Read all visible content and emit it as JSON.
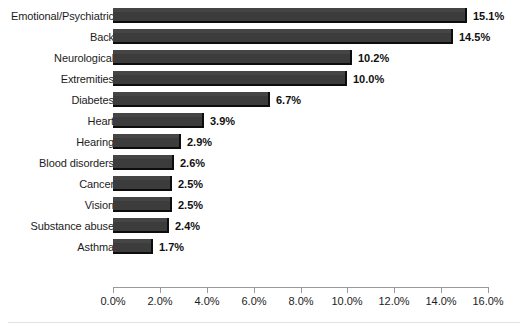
{
  "chart_data": {
    "type": "bar",
    "orientation": "horizontal",
    "title": "",
    "subtitle": "",
    "xlabel": "",
    "ylabel": "",
    "xlim": [
      0,
      16
    ],
    "grid": false,
    "legend": null,
    "bar_color": "#3c3c3c",
    "shadow_color": "#0d0d0d",
    "background": "#ffffff",
    "axis_color": "#9a9a9a",
    "text_color": "#1c1c1c",
    "value_suffix": "%",
    "categories": [
      "Emotional/Psychiatric",
      "Back",
      "Neurological",
      "Extremities",
      "Diabetes",
      "Heart",
      "Hearing",
      "Blood disorders",
      "Cancer",
      "Vision",
      "Substance abuse",
      "Asthma"
    ],
    "values": [
      15.1,
      14.5,
      10.2,
      10.0,
      6.7,
      3.9,
      2.9,
      2.6,
      2.5,
      2.5,
      2.4,
      1.7
    ],
    "data_labels": [
      "15.1%",
      "14.5%",
      "10.2%",
      "10.0%",
      "6.7%",
      "3.9%",
      "2.9%",
      "2.6%",
      "2.5%",
      "2.5%",
      "2.4%",
      "1.7%"
    ],
    "xticks": [
      0,
      2,
      4,
      6,
      8,
      10,
      12,
      14,
      16
    ],
    "xtick_labels": [
      "0.0%",
      "2.0%",
      "4.0%",
      "6.0%",
      "8.0%",
      "10.0%",
      "12.0%",
      "14.0%",
      "16.0%"
    ]
  }
}
